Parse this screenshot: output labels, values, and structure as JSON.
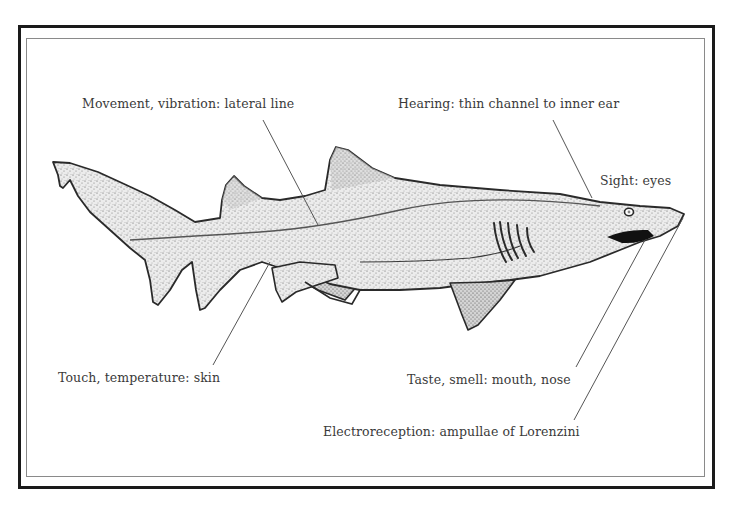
{
  "diagram": {
    "labels": {
      "lateral_line": "Movement, vibration: lateral line",
      "hearing": "Hearing: thin channel to inner ear",
      "sight": "Sight: eyes",
      "touch": "Touch, temperature: skin",
      "taste_smell": "Taste, smell: mouth, nose",
      "electroreception": "Electroreception: ampullae of Lorenzini"
    },
    "leaders": [
      {
        "label": "lateral_line",
        "from": [
          263,
          120
        ],
        "to": [
          318,
          225
        ]
      },
      {
        "label": "hearing",
        "from": [
          553,
          120
        ],
        "to": [
          592,
          198
        ]
      },
      {
        "label": "touch",
        "from": [
          270,
          262
        ],
        "to": [
          213,
          365
        ]
      },
      {
        "label": "taste_smell",
        "from": [
          645,
          240
        ],
        "to": [
          576,
          367
        ]
      },
      {
        "label": "electroreception",
        "from": [
          683,
          218
        ],
        "to": [
          574,
          420
        ]
      }
    ],
    "colors": {
      "frame_outer": "#1a1a1a",
      "frame_inner": "#8a8a8a",
      "text": "#3a3a3a",
      "outline": "#2a2a2a",
      "body_fill": "#e6e6e6",
      "leader": "#555555"
    }
  }
}
